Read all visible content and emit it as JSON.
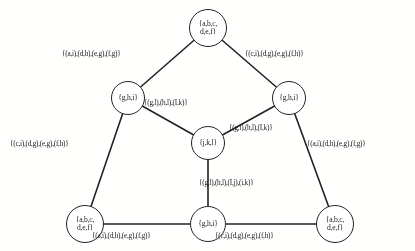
{
  "figure": {
    "background_color": "#fdfdfc",
    "ink_color": "#242424"
  },
  "nodes": [
    {
      "id": "top",
      "label_line1": "{a,b,c,",
      "label_line2": "d,e,f}",
      "cx": 208,
      "cy": 28,
      "r": 19
    },
    {
      "id": "mid-left",
      "label_line1": "{g,h,i}",
      "label_line2": "",
      "cx": 128,
      "cy": 98,
      "r": 17
    },
    {
      "id": "mid-right",
      "label_line1": "{g,h,i}",
      "label_line2": "",
      "cx": 289,
      "cy": 98,
      "r": 17
    },
    {
      "id": "center",
      "label_line1": "{j,k,l}",
      "label_line2": "",
      "cx": 208,
      "cy": 143,
      "r": 17
    },
    {
      "id": "bottom-left",
      "label_line1": "{a,b,c,",
      "label_line2": "d,e,f}",
      "cx": 85,
      "cy": 224,
      "r": 19
    },
    {
      "id": "bottom-center",
      "label_line1": "{g,h,i}",
      "label_line2": "",
      "cx": 208,
      "cy": 224,
      "r": 18
    },
    {
      "id": "bottom-right",
      "label_line1": "{a,b,c,",
      "label_line2": "d,e,f}",
      "cx": 335,
      "cy": 224,
      "r": 19
    }
  ],
  "edges": [
    {
      "id": "top-to-mid-left",
      "from": "top",
      "to": "mid-left",
      "label": "{(a,i),(d,h),(e,g),(f,g)}"
    },
    {
      "id": "top-to-mid-right",
      "from": "top",
      "to": "mid-right",
      "label": "{(c,i),(d,g),(e,g),(f,h)}"
    },
    {
      "id": "mid-left-to-center",
      "from": "mid-left",
      "to": "center",
      "label": "{(g,l),(h,l),(I,k)}"
    },
    {
      "id": "mid-right-to-center",
      "from": "mid-right",
      "to": "center",
      "label": "{(g,l),(h,l),(I,k)}"
    },
    {
      "id": "mid-left-to-bottom-left",
      "from": "mid-left",
      "to": "bottom-left",
      "label": "{(c,i),(d,g),(e,g),(f,h)}"
    },
    {
      "id": "mid-right-to-bottom-right",
      "from": "mid-right",
      "to": "bottom-right",
      "label": "{(a,i),(d,h),(e,g),(f,g)}"
    },
    {
      "id": "center-to-bottom-center",
      "from": "center",
      "to": "bottom-center",
      "label": "{(g,l),(h,l),(I,j),(i,k)}"
    },
    {
      "id": "bottom-left-to-bottom-center",
      "from": "bottom-left",
      "to": "bottom-center",
      "label": "{(a,i),(d,h),(e,g),(f,g)}"
    },
    {
      "id": "bottom-center-to-bottom-right",
      "from": "bottom-center",
      "to": "bottom-right",
      "label": "{(c,i),(d,g),(e,g),(f,h)}"
    }
  ],
  "edge_label_positions": [
    {
      "id": "top-to-mid-left",
      "left": 62,
      "top": 49
    },
    {
      "id": "top-to-mid-right",
      "left": 245,
      "top": 49
    },
    {
      "id": "mid-left-to-center",
      "left": 144,
      "top": 98
    },
    {
      "id": "mid-right-to-center",
      "left": 229,
      "top": 123
    },
    {
      "id": "mid-left-to-bottom-left",
      "left": 10,
      "top": 139
    },
    {
      "id": "mid-right-to-bottom-right",
      "left": 307,
      "top": 139
    },
    {
      "id": "center-to-bottom-center",
      "left": 199,
      "top": 178
    },
    {
      "id": "bottom-left-to-bottom-center",
      "left": 92,
      "top": 231
    },
    {
      "id": "bottom-center-to-bottom-right",
      "left": 215,
      "top": 231
    }
  ]
}
